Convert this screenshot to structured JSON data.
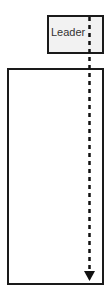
{
  "diagram": {
    "leader": {
      "label": "Leader"
    },
    "timeline": {
      "style": "dashed",
      "direction": "down",
      "color": "#111111"
    },
    "colors": {
      "leader_fill": "#f2f2f2",
      "border": "#1a1a1a",
      "main_fill": "#ffffff"
    }
  }
}
